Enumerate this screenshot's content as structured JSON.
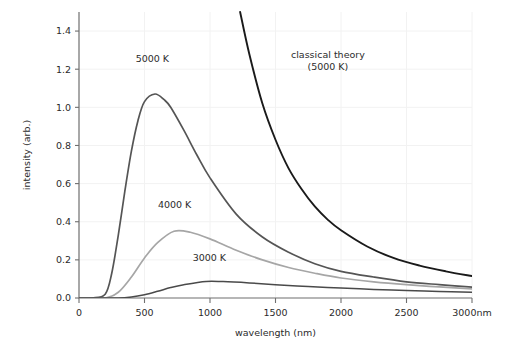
{
  "chart_data": {
    "type": "line",
    "title": "",
    "xlabel": "wavelength (nm)",
    "ylabel": "intensity (arb.)",
    "xlim": [
      0,
      3000
    ],
    "ylim": [
      0,
      1.5
    ],
    "grid": true,
    "legend_position": "inline-annotations",
    "x_ticks": [
      {
        "value": 0,
        "label": "0"
      },
      {
        "value": 500,
        "label": "500"
      },
      {
        "value": 1000,
        "label": "1000"
      },
      {
        "value": 1500,
        "label": "1500"
      },
      {
        "value": 2000,
        "label": "2000"
      },
      {
        "value": 2500,
        "label": "2500"
      },
      {
        "value": 3000,
        "label": "3000nm"
      }
    ],
    "y_ticks": [
      {
        "value": 0.0,
        "label": "0.0"
      },
      {
        "value": 0.2,
        "label": "0.2"
      },
      {
        "value": 0.4,
        "label": "0.4"
      },
      {
        "value": 0.6,
        "label": "0.6"
      },
      {
        "value": 0.8,
        "label": "0.8"
      },
      {
        "value": 1.0,
        "label": "1.0"
      },
      {
        "value": 1.2,
        "label": "1.2"
      },
      {
        "value": 1.4,
        "label": "1.4"
      }
    ],
    "series": [
      {
        "name": "5000 K",
        "label": "5000 K",
        "model": "planck",
        "temperature": 5000,
        "color": "#555555",
        "width": 1.7,
        "peak_wavelength": 580,
        "peak_intensity": 1.07,
        "label_x": 560,
        "label_y": 1.24,
        "points": [
          {
            "x": 0,
            "y": 0.0
          },
          {
            "x": 100,
            "y": 0.0
          },
          {
            "x": 200,
            "y": 0.02
          },
          {
            "x": 250,
            "y": 0.13
          },
          {
            "x": 300,
            "y": 0.33
          },
          {
            "x": 350,
            "y": 0.56
          },
          {
            "x": 400,
            "y": 0.77
          },
          {
            "x": 450,
            "y": 0.93
          },
          {
            "x": 500,
            "y": 1.03
          },
          {
            "x": 580,
            "y": 1.07
          },
          {
            "x": 650,
            "y": 1.04
          },
          {
            "x": 700,
            "y": 1.0
          },
          {
            "x": 800,
            "y": 0.88
          },
          {
            "x": 900,
            "y": 0.75
          },
          {
            "x": 1000,
            "y": 0.63
          },
          {
            "x": 1200,
            "y": 0.44
          },
          {
            "x": 1400,
            "y": 0.32
          },
          {
            "x": 1600,
            "y": 0.24
          },
          {
            "x": 1800,
            "y": 0.18
          },
          {
            "x": 2000,
            "y": 0.14
          },
          {
            "x": 2250,
            "y": 0.11
          },
          {
            "x": 2500,
            "y": 0.085
          },
          {
            "x": 2750,
            "y": 0.07
          },
          {
            "x": 3000,
            "y": 0.057
          }
        ]
      },
      {
        "name": "4000 K",
        "label": "4000 K",
        "model": "planck",
        "temperature": 4000,
        "color": "#a6a6a6",
        "width": 1.7,
        "peak_wavelength": 725,
        "peak_intensity": 0.35,
        "label_x": 730,
        "label_y": 0.47,
        "points": [
          {
            "x": 0,
            "y": 0.0
          },
          {
            "x": 200,
            "y": 0.0
          },
          {
            "x": 300,
            "y": 0.03
          },
          {
            "x": 400,
            "y": 0.11
          },
          {
            "x": 500,
            "y": 0.21
          },
          {
            "x": 600,
            "y": 0.29
          },
          {
            "x": 725,
            "y": 0.35
          },
          {
            "x": 850,
            "y": 0.345
          },
          {
            "x": 1000,
            "y": 0.31
          },
          {
            "x": 1200,
            "y": 0.25
          },
          {
            "x": 1400,
            "y": 0.2
          },
          {
            "x": 1600,
            "y": 0.16
          },
          {
            "x": 1800,
            "y": 0.13
          },
          {
            "x": 2000,
            "y": 0.105
          },
          {
            "x": 2250,
            "y": 0.085
          },
          {
            "x": 2500,
            "y": 0.07
          },
          {
            "x": 2750,
            "y": 0.058
          },
          {
            "x": 3000,
            "y": 0.048
          }
        ]
      },
      {
        "name": "3000 K",
        "label": "3000 K",
        "model": "planck",
        "temperature": 3000,
        "color": "#4a4a4a",
        "width": 1.5,
        "peak_wavelength": 970,
        "peak_intensity": 0.087,
        "label_x": 995,
        "label_y": 0.195,
        "points": [
          {
            "x": 0,
            "y": 0.0
          },
          {
            "x": 300,
            "y": 0.0
          },
          {
            "x": 400,
            "y": 0.005
          },
          {
            "x": 500,
            "y": 0.017
          },
          {
            "x": 600,
            "y": 0.035
          },
          {
            "x": 700,
            "y": 0.055
          },
          {
            "x": 800,
            "y": 0.07
          },
          {
            "x": 970,
            "y": 0.087
          },
          {
            "x": 1100,
            "y": 0.086
          },
          {
            "x": 1300,
            "y": 0.079
          },
          {
            "x": 1500,
            "y": 0.07
          },
          {
            "x": 1750,
            "y": 0.06
          },
          {
            "x": 2000,
            "y": 0.052
          },
          {
            "x": 2250,
            "y": 0.045
          },
          {
            "x": 2500,
            "y": 0.039
          },
          {
            "x": 2750,
            "y": 0.034
          },
          {
            "x": 3000,
            "y": 0.03
          }
        ]
      },
      {
        "name": "classical theory (5000 K)",
        "label": "classical theory",
        "label_line2": "(5000 K)",
        "model": "rayleigh-jeans",
        "temperature": 5000,
        "color": "#1a1a1a",
        "width": 1.9,
        "label_x": 1900,
        "label_y": 1.26,
        "points": [
          {
            "x": 1230,
            "y": 1.5
          },
          {
            "x": 1300,
            "y": 1.28
          },
          {
            "x": 1400,
            "y": 1.02
          },
          {
            "x": 1500,
            "y": 0.83
          },
          {
            "x": 1600,
            "y": 0.68
          },
          {
            "x": 1700,
            "y": 0.57
          },
          {
            "x": 1800,
            "y": 0.48
          },
          {
            "x": 1900,
            "y": 0.41
          },
          {
            "x": 2000,
            "y": 0.355
          },
          {
            "x": 2200,
            "y": 0.27
          },
          {
            "x": 2400,
            "y": 0.21
          },
          {
            "x": 2600,
            "y": 0.17
          },
          {
            "x": 2800,
            "y": 0.14
          },
          {
            "x": 3000,
            "y": 0.115
          }
        ]
      }
    ]
  }
}
